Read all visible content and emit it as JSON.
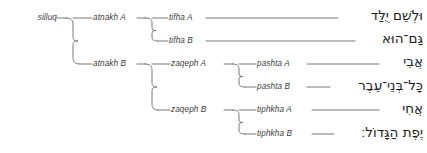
{
  "diagram": {
    "type": "hierarchical-tree",
    "orientation": "left-to-right",
    "line_color": "#6b6b6b",
    "label_color": "#3d3d3d",
    "hebrew_color": "#1c1c1c",
    "background_color": "#ffffff",
    "levels": [
      {
        "level": 0,
        "name": "silluq-level",
        "nodes": [
          {
            "id": "silluq",
            "label": "silluq",
            "x": 50,
            "y": 18
          }
        ]
      },
      {
        "level": 1,
        "name": "atnakh-level",
        "nodes": [
          {
            "id": "atnakh-a",
            "label": "atnakh A",
            "x": 130,
            "y": 18
          },
          {
            "id": "atnakh-b",
            "label": "atnakh B",
            "x": 130,
            "y": 64
          }
        ]
      },
      {
        "level": 2,
        "name": "tifha-zaqeph-level",
        "nodes": [
          {
            "id": "tifha-a",
            "label": "tifha A",
            "x": 200,
            "y": 18
          },
          {
            "id": "tifha-b",
            "label": "tifha B",
            "x": 200,
            "y": 41
          },
          {
            "id": "zaqeph-a",
            "label": "zaqeph A",
            "x": 215,
            "y": 64
          },
          {
            "id": "zaqeph-b",
            "label": "zaqeph B",
            "x": 215,
            "y": 110
          }
        ]
      },
      {
        "level": 3,
        "name": "pashta-tiphkha-level",
        "nodes": [
          {
            "id": "pashta-a",
            "label": "pashta A",
            "x": 300,
            "y": 64
          },
          {
            "id": "pashta-b",
            "label": "pashta B",
            "x": 300,
            "y": 87
          },
          {
            "id": "tiphkha-a",
            "label": "tiphkha A",
            "x": 303,
            "y": 110
          },
          {
            "id": "tiphkha-b",
            "label": "tiphkha B",
            "x": 303,
            "y": 134
          }
        ]
      }
    ],
    "hebrew_segments": [
      {
        "id": "segment-1",
        "text": "וּלְשֵׁם יֻלַּד",
        "parent": "tifha A",
        "x": 423,
        "y": 16
      },
      {
        "id": "segment-2",
        "text": "גַּם־הוּא",
        "parent": "tifha B",
        "x": 423,
        "y": 39
      },
      {
        "id": "segment-3",
        "text": "אֲבִי",
        "parent": "pashta A",
        "x": 423,
        "y": 62
      },
      {
        "id": "segment-4",
        "text": "כָּל־בְּנֵי־עֵבֶר",
        "parent": "pashta B",
        "x": 423,
        "y": 86
      },
      {
        "id": "segment-5",
        "text": "אֲחִי",
        "parent": "tiphkha A",
        "x": 423,
        "y": 109
      },
      {
        "id": "segment-6",
        "text": "יֶפֶת הַגָּדוֹל׃",
        "parent": "tiphkha B",
        "x": 423,
        "y": 133
      }
    ],
    "connectors": [
      {
        "id": "conn-silluq",
        "from": "silluq",
        "to": [
          "atnakh A",
          "atnakh B"
        ]
      },
      {
        "id": "conn-atnakh-a",
        "from": "atnakh A",
        "to": [
          "tifha A",
          "tifha B"
        ]
      },
      {
        "id": "conn-atnakh-b",
        "from": "atnakh B",
        "to": [
          "zaqeph A",
          "zaqeph B"
        ]
      },
      {
        "id": "conn-zaqeph-a",
        "from": "zaqeph A",
        "to": [
          "pashta A",
          "pashta B"
        ]
      },
      {
        "id": "conn-zaqeph-b",
        "from": "zaqeph B",
        "to": [
          "tiphkha A",
          "tiphkha B"
        ]
      },
      {
        "id": "rule-tifha-a",
        "from": "tifha A",
        "to": [
          "segment-1"
        ]
      },
      {
        "id": "rule-tifha-b",
        "from": "tifha B",
        "to": [
          "segment-2"
        ]
      },
      {
        "id": "rule-pashta-a",
        "from": "pashta A",
        "to": [
          "segment-3"
        ]
      },
      {
        "id": "rule-pashta-b",
        "from": "pashta B",
        "to": [
          "segment-4"
        ]
      },
      {
        "id": "rule-tiphkha-a",
        "from": "tiphkha A",
        "to": [
          "segment-5"
        ]
      },
      {
        "id": "rule-tiphkha-b",
        "from": "tiphkha B",
        "to": [
          "segment-6"
        ]
      }
    ]
  }
}
